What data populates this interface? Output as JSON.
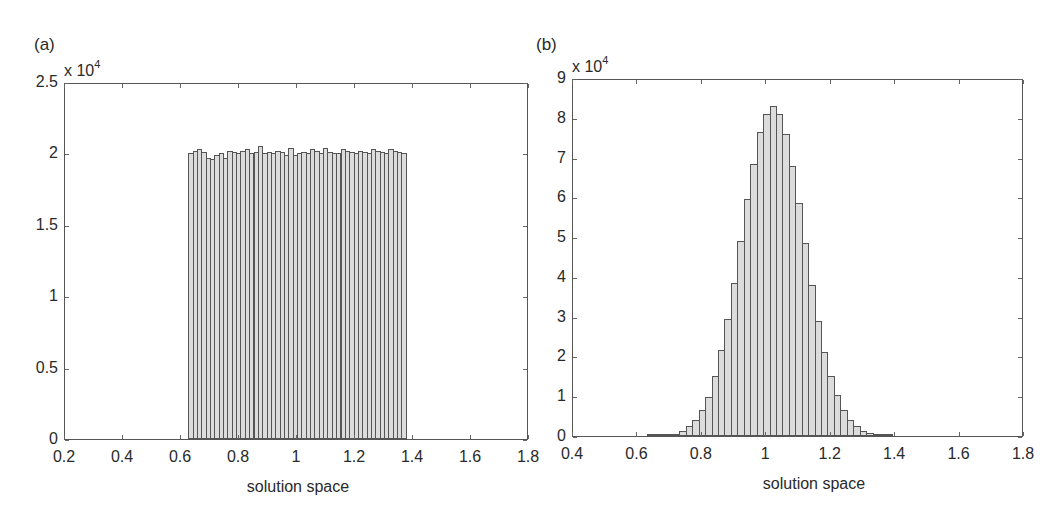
{
  "chart_data": [
    {
      "type": "bar",
      "panel": "(a)",
      "title": "",
      "xlabel": "solution space",
      "ylabel": "",
      "y_multiplier": "x 10^4",
      "xlim": [
        0.2,
        1.8
      ],
      "ylim": [
        0,
        2.5
      ],
      "xticks": [
        "0.2",
        "0.4",
        "0.6",
        "0.8",
        "1",
        "1.2",
        "1.4",
        "1.6",
        "1.8"
      ],
      "yticks": [
        "0",
        "0.5",
        "1",
        "1.5",
        "2",
        "2.5"
      ],
      "grid": false,
      "bin_start": 0.625,
      "bin_width": 0.015,
      "values": [
        2.0,
        2.02,
        2.03,
        2.01,
        1.97,
        1.96,
        1.99,
        2.0,
        1.97,
        2.02,
        2.01,
        2.0,
        2.02,
        2.03,
        2.0,
        2.01,
        2.05,
        2.0,
        2.01,
        2.0,
        2.02,
        2.01,
        1.99,
        2.04,
        1.99,
        2.0,
        2.01,
        2.0,
        2.03,
        2.02,
        2.0,
        2.04,
        2.01,
        2.0,
        2.0,
        2.03,
        2.02,
        2.01,
        2.0,
        2.02,
        2.01,
        2.0,
        2.03,
        2.02,
        2.01,
        2.0,
        2.03,
        2.02,
        2.01,
        2.0
      ]
    },
    {
      "type": "bar",
      "panel": "(b)",
      "title": "",
      "xlabel": "solution space",
      "ylabel": "",
      "y_multiplier": "x 10^4",
      "xlim": [
        0.4,
        1.8
      ],
      "ylim": [
        0,
        9
      ],
      "xticks": [
        "0.4",
        "0.6",
        "0.8",
        "1",
        "1.2",
        "1.4",
        "1.6",
        "1.8"
      ],
      "yticks": [
        "0",
        "1",
        "2",
        "3",
        "4",
        "5",
        "6",
        "7",
        "8",
        "9"
      ],
      "grid": false,
      "bin_start": 0.63,
      "bin_width": 0.02,
      "values": [
        0.01,
        0.01,
        0.02,
        0.03,
        0.06,
        0.13,
        0.24,
        0.4,
        0.65,
        0.98,
        1.5,
        2.15,
        2.95,
        3.85,
        4.9,
        5.95,
        6.85,
        7.65,
        8.1,
        8.3,
        8.1,
        7.6,
        6.8,
        5.85,
        4.85,
        3.8,
        2.9,
        2.1,
        1.5,
        1.02,
        0.65,
        0.4,
        0.25,
        0.13,
        0.07,
        0.03,
        0.01,
        0.01
      ]
    }
  ],
  "panels": {
    "a": {
      "label": "(a)",
      "exp_base": "x 10",
      "exp_power": "4",
      "xlabel": "solution space"
    },
    "b": {
      "label": "(b)",
      "exp_base": "x 10",
      "exp_power": "4",
      "xlabel": "solution space"
    }
  }
}
